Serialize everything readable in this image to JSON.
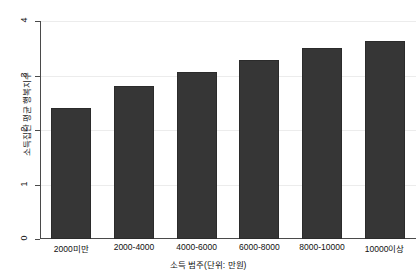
{
  "chart_data": {
    "type": "bar",
    "title": "",
    "subtitle": "",
    "xlabel": "소득 범주(단위: 만원)",
    "ylabel": "소득집단 평균 행복지수",
    "categories": [
      "2000미만",
      "2000-4000",
      "4000-6000",
      "6000-8000",
      "8000-10000",
      "10000이상"
    ],
    "values": [
      2.4,
      2.81,
      3.06,
      3.28,
      3.5,
      3.63
    ],
    "series": [
      {
        "name": "소득집단 평균 행복지수",
        "values": [
          2.4,
          2.81,
          3.06,
          3.28,
          3.5,
          3.63
        ]
      }
    ],
    "ylim": [
      0,
      4
    ],
    "yticks": [
      0,
      1,
      2,
      3,
      4
    ],
    "ytick_labels": [
      "0",
      "1",
      "2",
      "3",
      "4"
    ],
    "grid": true,
    "grid_axis": "y",
    "legend": false,
    "legend_position": "none",
    "bar_color": "#363636",
    "bar_edge_color": "#2b2b2b",
    "grid_color": "#ececec",
    "axis_color": "#4a4a4a",
    "background_color": "#ffffff",
    "text_color": "#111111"
  }
}
